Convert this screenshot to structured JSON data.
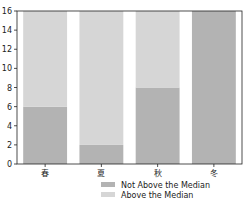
{
  "chart_data": {
    "type": "bar",
    "stacked": true,
    "title": "",
    "xlabel": "",
    "ylabel": "",
    "categories": [
      "春",
      "夏",
      "秋",
      "冬"
    ],
    "series": [
      {
        "name": "Not Above the Median",
        "values": [
          6,
          2,
          8,
          16
        ],
        "color": "#b3b3b3"
      },
      {
        "name": "Above the Median",
        "values": [
          10,
          14,
          8,
          0
        ],
        "color": "#d6d6d6"
      }
    ],
    "ylim": [
      0,
      16
    ],
    "yticks": [
      0,
      2,
      4,
      6,
      8,
      10,
      12,
      14,
      16
    ],
    "grid": false,
    "legend_position": "bottom-center"
  },
  "legend": {
    "items": [
      {
        "label": "Not Above the Median",
        "color": "#b3b3b3"
      },
      {
        "label": "Above the Median",
        "color": "#d6d6d6"
      }
    ]
  }
}
